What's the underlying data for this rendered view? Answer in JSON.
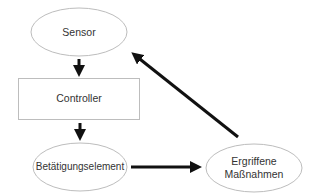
{
  "diagram": {
    "type": "control-loop flowchart",
    "nodes": [
      {
        "id": "sensor",
        "shape": "ellipse",
        "label": "Sensor"
      },
      {
        "id": "controller",
        "shape": "rectangle",
        "label": "Controller"
      },
      {
        "id": "actuator",
        "shape": "ellipse",
        "label": "Betätigungselement"
      },
      {
        "id": "actions",
        "shape": "ellipse",
        "label_line1": "Ergriffene",
        "label_line2": "Maßnahmen"
      }
    ],
    "edges": [
      {
        "from": "sensor",
        "to": "controller"
      },
      {
        "from": "controller",
        "to": "actuator"
      },
      {
        "from": "actuator",
        "to": "actions"
      },
      {
        "from": "actions",
        "to": "sensor"
      }
    ],
    "colors": {
      "stroke": "#bdbdbd",
      "arrow": "#111111",
      "text": "#333333",
      "background": "#ffffff"
    }
  }
}
